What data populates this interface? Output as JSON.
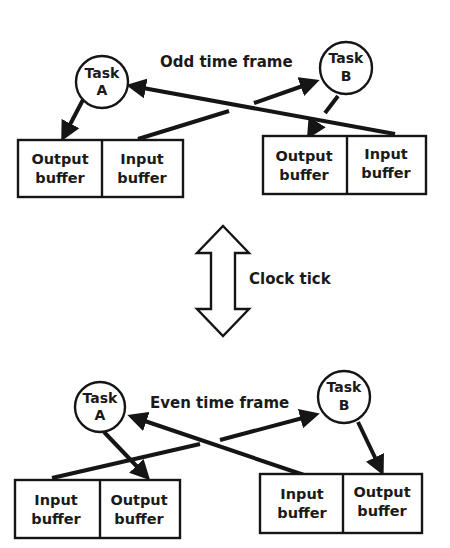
{
  "diagram": {
    "odd_frame": {
      "title": "Odd time frame",
      "task_a": {
        "line1": "Task",
        "line2": "A"
      },
      "task_b": {
        "line1": "Task",
        "line2": "B"
      },
      "left_buffers": [
        {
          "line1": "Output",
          "line2": "buffer"
        },
        {
          "line1": "Input",
          "line2": "buffer"
        }
      ],
      "right_buffers": [
        {
          "line1": "Output",
          "line2": "buffer"
        },
        {
          "line1": "Input",
          "line2": "buffer"
        }
      ]
    },
    "clock": {
      "label": "Clock tick"
    },
    "even_frame": {
      "title": "Even time frame",
      "task_a": {
        "line1": "Task",
        "line2": "A"
      },
      "task_b": {
        "line1": "Task",
        "line2": "B"
      },
      "left_buffers": [
        {
          "line1": "Input",
          "line2": "buffer"
        },
        {
          "line1": "Output",
          "line2": "buffer"
        }
      ],
      "right_buffers": [
        {
          "line1": "Input",
          "line2": "buffer"
        },
        {
          "line1": "Output",
          "line2": "buffer"
        }
      ]
    },
    "colors": {
      "ink": "#151515",
      "background": "#ffffff"
    }
  }
}
